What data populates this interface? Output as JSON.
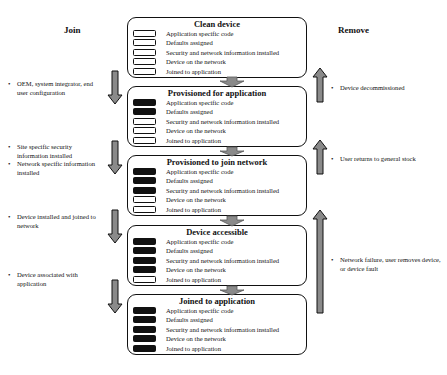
{
  "columns": {
    "join_title": "Join",
    "remove_title": "Remove"
  },
  "row_labels": [
    "Application specific code",
    "Defaults assigned",
    "Security and network information installed",
    " Device on the network",
    "Joined to application"
  ],
  "states": [
    {
      "title": "Clean device",
      "filled": [
        false,
        false,
        false,
        false,
        false
      ],
      "rows": [
        "Application specific code",
        "Defaults assigned",
        "Security and network information installed",
        "Device on the network",
        "Joined to application"
      ]
    },
    {
      "title": "Provisioned for application",
      "filled": [
        true,
        true,
        false,
        false,
        false
      ],
      "rows": [
        "Application specific code",
        "Defaults assigned",
        "Security and network information installed",
        "Device on the network",
        "Joined to application"
      ]
    },
    {
      "title": "Provisioned to join network",
      "filled": [
        true,
        true,
        true,
        false,
        false
      ],
      "rows": [
        "Application specific code",
        "Defaults assigned",
        "Security and network information installed",
        "Device on the network",
        "Joined to application"
      ]
    },
    {
      "title": "Device accessible",
      "filled": [
        true,
        true,
        true,
        true,
        false
      ],
      "rows": [
        "Application specific code",
        "Defaults assigned",
        "Security and network information installed",
        "Device on the network",
        "Joined to application"
      ]
    },
    {
      "title": "Joined to application",
      "filled": [
        true,
        true,
        true,
        true,
        true
      ],
      "rows": [
        "Application specific code",
        "Defaults assigned",
        "Security and network information installed",
        "Device on the network",
        "Joined to application"
      ]
    }
  ],
  "join_notes": [
    {
      "items": [
        "OEM, system integrator, end user configuration"
      ]
    },
    {
      "items": [
        "Site specific security information installed",
        "Network specific information installed"
      ]
    },
    {
      "items": [
        "Device installed and joined to network"
      ]
    },
    {
      "items": [
        "Device associated with application"
      ]
    }
  ],
  "remove_notes": [
    {
      "items": [
        "Device decommissioned"
      ]
    },
    {
      "items": [
        "User returns to general stock"
      ]
    },
    {
      "items": [
        "Network failure, user removes device, or device fault"
      ]
    }
  ],
  "colors": {
    "arrow_fill": "#8a8a8a",
    "stroke": "#111111",
    "indicator_on": "#111111",
    "background": "#ffffff"
  }
}
